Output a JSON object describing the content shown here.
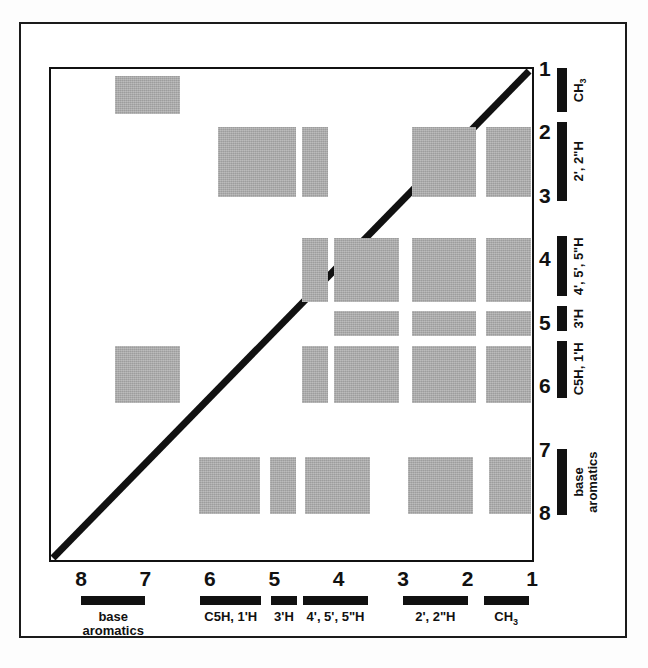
{
  "figure": {
    "peak_color": "#a8a8a8",
    "line_color": "#111111",
    "background": "#ffffff"
  },
  "axes": {
    "x": {
      "label": "",
      "ticks": [
        "8",
        "7",
        "6",
        "5",
        "4",
        "3",
        "2",
        "1"
      ],
      "range_ppm": [
        8,
        1
      ],
      "direction": "decreasing"
    },
    "y": {
      "label": "",
      "ticks": [
        "1",
        "2",
        "3",
        "4",
        "5",
        "6",
        "7",
        "8"
      ],
      "range_ppm": [
        1,
        8
      ],
      "direction": "increasing"
    }
  },
  "x_assignments": [
    {
      "name": "base aromatics",
      "label": "base\naromatics",
      "from_ppm": 8.0,
      "to_ppm": 7.0
    },
    {
      "name": "C5H, 1'H",
      "label": "C5H, 1'H",
      "from_ppm": 6.15,
      "to_ppm": 5.2
    },
    {
      "name": "3'H",
      "label": "3'H",
      "from_ppm": 5.05,
      "to_ppm": 4.65
    },
    {
      "name": "4', 5', 5\"H",
      "label": "4', 5', 5\"H",
      "from_ppm": 4.55,
      "to_ppm": 3.55
    },
    {
      "name": "2', 2\"H",
      "label": "2', 2\"H",
      "from_ppm": 3.0,
      "to_ppm": 2.0
    },
    {
      "name": "CH3",
      "label": "CH₃",
      "from_ppm": 1.75,
      "to_ppm": 1.05
    }
  ],
  "y_assignments": [
    {
      "name": "CH3",
      "label": "CH₃",
      "from_ppm": 1.0,
      "to_ppm": 1.7
    },
    {
      "name": "2', 2\"H",
      "label": "2', 2\"H",
      "from_ppm": 1.85,
      "to_ppm": 3.1
    },
    {
      "name": "4', 5', 5\"H",
      "label": "4', 5', 5\"H",
      "from_ppm": 3.65,
      "to_ppm": 4.6
    },
    {
      "name": "3'H",
      "label": "3'H",
      "from_ppm": 4.75,
      "to_ppm": 5.15
    },
    {
      "name": "C5H, 1'H",
      "label": "C5H, 1'H",
      "from_ppm": 5.3,
      "to_ppm": 6.2
    },
    {
      "name": "base aromatics",
      "label": "base\naromatics",
      "from_ppm": 7.0,
      "to_ppm": 8.05
    }
  ],
  "chart_data": {
    "type": "heatmap",
    "xlabel": "",
    "ylabel": "",
    "xlim": [
      8,
      1
    ],
    "ylim": [
      1,
      8
    ],
    "grid": false,
    "legend": "none",
    "diagonal": {
      "from": [
        8,
        8
      ],
      "to": [
        1,
        1
      ],
      "color": "#111111",
      "width_px": 6
    },
    "note": "Shaded rectangles mark NOE cross-peak regions between proton groups (ppm).",
    "peaks": [
      {
        "x_from": 7.5,
        "x_to": 6.5,
        "y_from": 1.1,
        "y_to": 1.7,
        "groups": "CH3 / base aromatics"
      },
      {
        "x_from": 5.9,
        "x_to": 4.7,
        "y_from": 1.9,
        "y_to": 3.0,
        "groups": "2',2\"H / C5H,1'H"
      },
      {
        "x_from": 4.6,
        "x_to": 4.2,
        "y_from": 1.9,
        "y_to": 3.0,
        "groups": "2',2\"H / 3'H"
      },
      {
        "x_from": 2.9,
        "x_to": 1.9,
        "y_from": 1.9,
        "y_to": 3.0,
        "groups": "2',2\"H / 2',2\"H"
      },
      {
        "x_from": 1.75,
        "x_to": 1.05,
        "y_from": 1.9,
        "y_to": 3.0,
        "groups": "2',2\"H / CH3"
      },
      {
        "x_from": 4.6,
        "x_to": 4.2,
        "y_from": 3.65,
        "y_to": 4.65,
        "groups": "4',5',5\"H / 3'H"
      },
      {
        "x_from": 4.1,
        "x_to": 3.1,
        "y_from": 3.65,
        "y_to": 4.65,
        "groups": "4',5',5\"H / 4',5',5\"H"
      },
      {
        "x_from": 2.9,
        "x_to": 1.9,
        "y_from": 3.65,
        "y_to": 4.65,
        "groups": "4',5',5\"H / 2',2\"H"
      },
      {
        "x_from": 1.75,
        "x_to": 1.05,
        "y_from": 3.65,
        "y_to": 4.65,
        "groups": "4',5',5\"H / CH3"
      },
      {
        "x_from": 4.1,
        "x_to": 3.1,
        "y_from": 4.8,
        "y_to": 5.2,
        "groups": "3'H / 4',5',5\"H"
      },
      {
        "x_from": 2.9,
        "x_to": 1.9,
        "y_from": 4.8,
        "y_to": 5.2,
        "groups": "3'H / 2',2\"H"
      },
      {
        "x_from": 1.75,
        "x_to": 1.05,
        "y_from": 4.8,
        "y_to": 5.2,
        "groups": "3'H / CH3"
      },
      {
        "x_from": 7.5,
        "x_to": 6.5,
        "y_from": 5.35,
        "y_to": 6.25,
        "groups": "C5H,1'H / base aromatics"
      },
      {
        "x_from": 4.6,
        "x_to": 4.2,
        "y_from": 5.35,
        "y_to": 6.25,
        "groups": "C5H,1'H / 3'H"
      },
      {
        "x_from": 4.1,
        "x_to": 3.1,
        "y_from": 5.35,
        "y_to": 6.25,
        "groups": "C5H,1'H / 4',5',5\"H"
      },
      {
        "x_from": 2.9,
        "x_to": 1.9,
        "y_from": 5.35,
        "y_to": 6.25,
        "groups": "C5H,1'H / 2',2\"H"
      },
      {
        "x_from": 1.75,
        "x_to": 1.05,
        "y_from": 5.35,
        "y_to": 6.25,
        "groups": "C5H,1'H / CH3"
      },
      {
        "x_from": 6.2,
        "x_to": 5.25,
        "y_from": 7.1,
        "y_to": 8.0,
        "groups": "base aromatics / C5H,1'H"
      },
      {
        "x_from": 5.1,
        "x_to": 4.7,
        "y_from": 7.1,
        "y_to": 8.0,
        "groups": "base aromatics / 3'H"
      },
      {
        "x_from": 4.55,
        "x_to": 3.55,
        "y_from": 7.1,
        "y_to": 8.0,
        "groups": "base aromatics / 4',5',5\"H"
      },
      {
        "x_from": 2.95,
        "x_to": 1.95,
        "y_from": 7.1,
        "y_to": 8.0,
        "groups": "base aromatics / 2',2\"H"
      },
      {
        "x_from": 1.7,
        "x_to": 1.05,
        "y_from": 7.1,
        "y_to": 8.0,
        "groups": "base aromatics / CH3"
      }
    ]
  }
}
